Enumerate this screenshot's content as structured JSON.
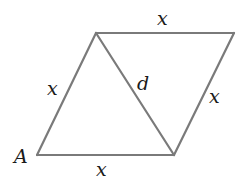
{
  "figure": {
    "type": "rhombus-with-diagonal",
    "colors": {
      "line": "#7a7a7a",
      "text": "#1a1a1a",
      "background": "#ffffff"
    },
    "vertices": {
      "bottom_left": [
        37,
        155
      ],
      "bottom_right": [
        174,
        155
      ],
      "top_left": [
        96,
        33
      ],
      "top_right": [
        234,
        33
      ]
    },
    "labels": {
      "top_side": "x",
      "left_side": "x",
      "right_side": "x",
      "bottom_side": "x",
      "diagonal": "d",
      "vertex_A": "A"
    }
  }
}
